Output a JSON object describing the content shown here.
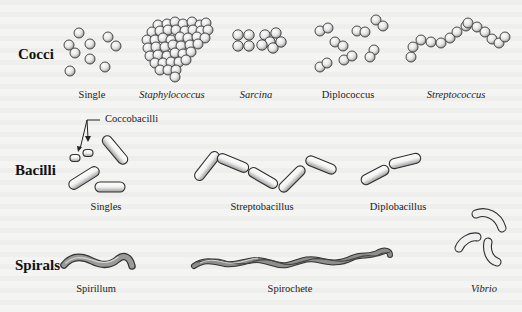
{
  "colors": {
    "background": "#f4f4f2",
    "outline": "#3a3a3a",
    "cell_fill_light": "#ffffff",
    "cell_fill_dark": "#9a9a9a",
    "spiral_fill": "#8c8c8c",
    "text": "#222222"
  },
  "rows": [
    {
      "label": "Cocci",
      "forms": [
        {
          "name": "Single",
          "italic": false
        },
        {
          "name": "Staphylococcus",
          "italic": true
        },
        {
          "name": "Sarcina",
          "italic": true
        },
        {
          "name": "Diplococcus",
          "italic": false
        },
        {
          "name": "Streptococcus",
          "italic": true
        }
      ]
    },
    {
      "label": "Bacilli",
      "callout": "Coccobacilli",
      "forms": [
        {
          "name": "Singles",
          "italic": false
        },
        {
          "name": "Streptobacillus",
          "italic": false
        },
        {
          "name": "Diplobacillus",
          "italic": false
        }
      ]
    },
    {
      "label": "Spirals",
      "forms": [
        {
          "name": "Spirillum",
          "italic": false
        },
        {
          "name": "Spirochete",
          "italic": false
        },
        {
          "name": "Vibrio",
          "italic": true
        }
      ]
    }
  ]
}
